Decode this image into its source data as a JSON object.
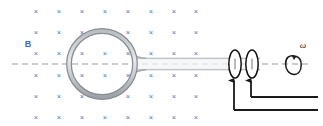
{
  "figure": {
    "background_color": "#ffffff",
    "width": 323,
    "height": 126
  },
  "colors": {
    "field_blue": "#4a6fc4",
    "label_blue": "#3b64c8",
    "coil_gray": "#8f9296",
    "coil_light": "#c9ccd0",
    "shaft_gray": "#9aa0a6",
    "axis_gray": "#9a9a9a",
    "wire_black": "#1a1a1a",
    "ring_black": "#111111"
  },
  "labels": {
    "magnetic_field": "B",
    "angular_velocity": "ω"
  },
  "field_region": {
    "symbol": "×",
    "meaning": "magnetic-field-into-page",
    "columns": 8,
    "rows": 6,
    "x_positions": [
      36,
      59,
      82,
      105,
      128,
      151,
      174,
      196
    ],
    "y_positions": [
      12,
      33,
      54,
      76,
      97,
      118
    ]
  },
  "loop": {
    "name": "conducting-loop",
    "center_x": 102,
    "center_y": 64,
    "outer_radius": 35,
    "inner_radius": 31
  },
  "shaft": {
    "name": "rotation-shaft",
    "x_start": 136,
    "x_end": 260,
    "top_y": 58,
    "bottom_y": 70
  },
  "axis": {
    "name": "rotation-axis",
    "y": 64,
    "x_start": 12,
    "x_end": 312,
    "style": "dashed"
  },
  "slip_rings": [
    {
      "name": "slip-ring-1",
      "cx": 235,
      "cy": 64,
      "rx": 6,
      "ry": 14
    },
    {
      "name": "slip-ring-2",
      "cx": 252,
      "cy": 64,
      "rx": 6,
      "ry": 14
    }
  ],
  "brush_wires": [
    {
      "name": "brush-wire-1",
      "ring_x": 234,
      "arrow_tip_y": 79,
      "corner_y": 110,
      "end_x": 318
    },
    {
      "name": "brush-wire-2",
      "ring_x": 251,
      "arrow_tip_y": 79,
      "corner_y": 97,
      "end_x": 318
    }
  ],
  "rotation_indicator": {
    "name": "omega-rotation-arrow",
    "cx": 291,
    "cy": 64,
    "label_x": 302,
    "label_y": 48
  }
}
